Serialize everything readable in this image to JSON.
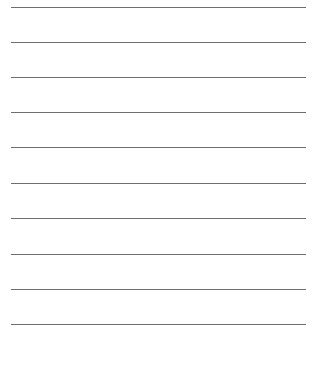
{
  "page": {
    "type": "lined-paper",
    "background_color": "#ffffff",
    "line_color": "#555555",
    "line_count": 10,
    "lines_y": [
      7,
      42,
      77,
      112,
      147,
      183,
      218,
      254,
      289,
      324
    ],
    "line_x_start": 11,
    "line_x_end": 306
  }
}
